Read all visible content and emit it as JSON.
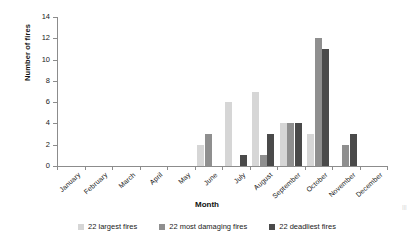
{
  "chart_data": {
    "type": "bar",
    "title": "",
    "xlabel": "Month",
    "ylabel": "Number of fires",
    "categories": [
      "January",
      "February",
      "March",
      "April",
      "May",
      "June",
      "July",
      "August",
      "September",
      "October",
      "November",
      "December"
    ],
    "series": [
      {
        "name": "22 largest fires",
        "color": "#d6d6d6",
        "values": [
          0,
          0,
          0,
          0,
          0,
          2,
          6,
          7,
          4,
          3,
          0,
          0
        ]
      },
      {
        "name": "22 most damaging fires",
        "color": "#8f8f8f",
        "values": [
          0,
          0,
          0,
          0,
          0,
          3,
          0,
          1,
          4,
          12,
          2,
          0
        ]
      },
      {
        "name": "22 deadliest fires",
        "color": "#4a4a4a",
        "values": [
          0,
          0,
          0,
          0,
          0,
          0,
          1,
          3,
          4,
          11,
          3,
          0
        ]
      }
    ],
    "ylim": [
      0,
      14
    ],
    "yticks": [
      0,
      2,
      4,
      6,
      8,
      10,
      12,
      14
    ],
    "grid": false,
    "legend_position": "bottom"
  },
  "axis": {
    "y_title": "Number of fires",
    "x_title": "Month"
  },
  "edge_caption": "|||"
}
